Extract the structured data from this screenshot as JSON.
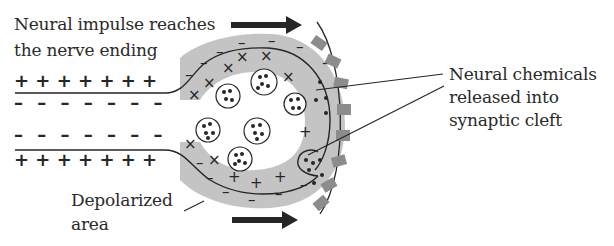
{
  "labels": {
    "impulse_line1": "Neural impulse reaches",
    "impulse_line2": "the nerve ending",
    "chemicals_line1": "Neural chemicals",
    "chemicals_line2": "released into",
    "chemicals_line3": "synaptic cleft",
    "depolarized_line1": "Depolarized",
    "depolarized_line2": "area"
  },
  "symbols": {
    "plus": "+",
    "minus": "−",
    "membrane_plus_row": "+ + + + + + +",
    "membrane_minus_row": "–  –  –  –  –  –  –"
  },
  "colors": {
    "depolarized_fill": "#c4c4c4",
    "receptor_fill": "#8c8c8c",
    "ink": "#262626"
  }
}
